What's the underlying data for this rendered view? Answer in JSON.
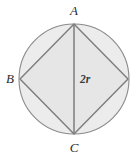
{
  "figure": {
    "background_color": "#ffffff",
    "circle": {
      "name": "circle",
      "center_x": 74,
      "center_y": 79,
      "radius": 55,
      "fill_color": "#ececec",
      "stroke_color": "#8a8a8a",
      "stroke_width": 1.1
    },
    "rhombus": {
      "name": "inscribed-rhombus",
      "fill_color": "#e6e6e6",
      "stroke_color": "#7d7d7d",
      "stroke_width": 1.4,
      "vertices": [
        {
          "id": "A",
          "x": 74,
          "y": 24,
          "position": "top"
        },
        {
          "id": "right",
          "x": 128,
          "y": 79,
          "position": "right"
        },
        {
          "id": "C",
          "x": 74,
          "y": 134,
          "position": "bottom"
        },
        {
          "id": "B",
          "x": 20,
          "y": 79,
          "position": "left"
        }
      ]
    },
    "diameter": {
      "name": "vertical-diameter",
      "from_x": 74,
      "from_y": 24,
      "to_x": 74,
      "to_y": 134,
      "stroke_color": "#7d7d7d",
      "stroke_width": 1.5,
      "label": "2r",
      "label_x": 80,
      "label_y": 83
    },
    "labels": [
      {
        "id": "label-A",
        "text": "A",
        "x": 74,
        "y": 15,
        "anchor": "middle"
      },
      {
        "id": "label-B",
        "text": "B",
        "x": 10,
        "y": 83,
        "anchor": "middle"
      },
      {
        "id": "label-C",
        "text": "C",
        "x": 74,
        "y": 152,
        "anchor": "middle"
      }
    ]
  }
}
